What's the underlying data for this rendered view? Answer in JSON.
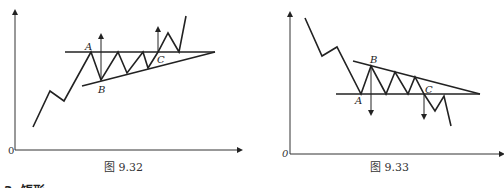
{
  "figures": [
    {
      "caption": "图 9.32",
      "origin_label": "0",
      "labels": {
        "A": "A",
        "B": "B",
        "C": "C"
      }
    },
    {
      "caption": "图 9.33",
      "origin_label": "0",
      "labels": {
        "A": "A",
        "B": "B",
        "C": "C"
      }
    }
  ],
  "partial_heading": "3. 矩形"
}
